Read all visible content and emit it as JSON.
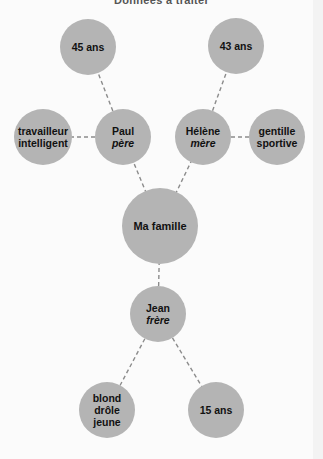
{
  "title": "Données à traiter",
  "colors": {
    "node_fill": "#b4b4b4",
    "link": "#8c8c8c",
    "background": "#fbfbfb",
    "text": "#111111"
  },
  "nodes": {
    "center": {
      "lines": [
        "Ma famille"
      ]
    },
    "paul": {
      "name": "Paul",
      "role": "père"
    },
    "helene": {
      "name": "Hélène",
      "role": "mère"
    },
    "jean": {
      "name": "Jean",
      "role": "frère"
    },
    "paul_age": {
      "lines": [
        "45 ans"
      ]
    },
    "helene_age": {
      "lines": [
        "43 ans"
      ]
    },
    "paul_traits": {
      "lines": [
        "travailleur",
        "intelligent"
      ]
    },
    "helene_traits": {
      "lines": [
        "gentille",
        "sportive"
      ]
    },
    "jean_traits": {
      "lines": [
        "blond",
        "drôle",
        "jeune"
      ]
    },
    "jean_age": {
      "lines": [
        "15 ans"
      ]
    }
  },
  "edges": [
    [
      "center",
      "paul"
    ],
    [
      "center",
      "helene"
    ],
    [
      "center",
      "jean"
    ],
    [
      "paul",
      "paul_age"
    ],
    [
      "paul",
      "paul_traits"
    ],
    [
      "helene",
      "helene_age"
    ],
    [
      "helene",
      "helene_traits"
    ],
    [
      "jean",
      "jean_traits"
    ],
    [
      "jean",
      "jean_age"
    ]
  ]
}
